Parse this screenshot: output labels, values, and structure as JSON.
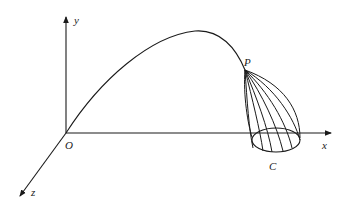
{
  "figure": {
    "type": "3D coordinate diagram",
    "colors": {
      "ink": "#1a1a1a",
      "background": "#ffffff"
    }
  },
  "axes": {
    "y_label": "y",
    "x_label": "x",
    "z_label": "z",
    "origin_label": "O"
  },
  "points": {
    "P_label": "P",
    "C_label": "C"
  }
}
